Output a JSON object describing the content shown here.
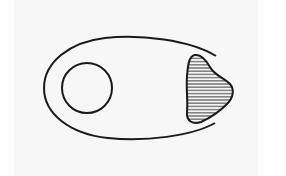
{
  "diagram": {
    "colors": {
      "background": "#f7f7f7",
      "stroke": "#1a1a1a",
      "hatch": "#2a2a2a"
    },
    "elements": [
      {
        "id": "outer-oval",
        "shape": "open-ellipse-arc"
      },
      {
        "id": "inner-circle",
        "shape": "circle",
        "cx": 87,
        "cy": 88,
        "r": 25
      },
      {
        "id": "hatched-blob",
        "shape": "irregular-blob",
        "fill": "horizontal-hatch"
      }
    ]
  }
}
